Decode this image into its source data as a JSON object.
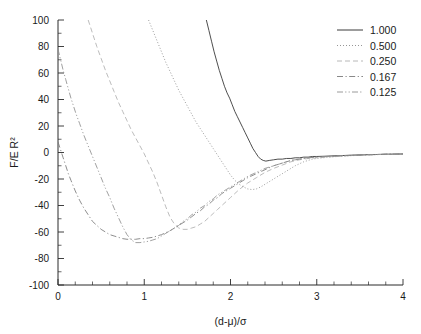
{
  "chart_data": {
    "type": "line",
    "title": "",
    "subtitle": "",
    "xlabel": "(d-μ)/σ",
    "ylabel": "F/E R²",
    "xlim": [
      0,
      4
    ],
    "ylim": [
      -100,
      100
    ],
    "grid": false,
    "legend_position": "top-right",
    "x_ticks": [
      "0",
      "1",
      "2",
      "3",
      "4"
    ],
    "x_tick_values": [
      0,
      1,
      2,
      3,
      4
    ],
    "x_minor_ticks_per_interval": 5,
    "y_ticks": [
      "100",
      "80",
      "60",
      "40",
      "20",
      "0",
      "-20",
      "-40",
      "-60",
      "-80",
      "-100"
    ],
    "y_tick_values": [
      100,
      80,
      60,
      40,
      20,
      0,
      -20,
      -40,
      -60,
      -80,
      -100
    ],
    "y_minor_ticks_per_interval": 2,
    "series": [
      {
        "name": "1.000",
        "style": "solid",
        "color": "#3a3a3a",
        "points": [
          [
            1.72,
            100
          ],
          [
            1.75,
            92
          ],
          [
            1.78,
            84
          ],
          [
            1.81,
            76
          ],
          [
            1.84,
            69
          ],
          [
            1.87,
            62
          ],
          [
            1.9,
            56
          ],
          [
            1.93,
            50
          ],
          [
            1.96,
            45
          ],
          [
            1.99,
            41
          ],
          [
            2.02,
            36
          ],
          [
            2.05,
            31
          ],
          [
            2.08,
            27
          ],
          [
            2.11,
            23
          ],
          [
            2.14,
            19
          ],
          [
            2.17,
            15
          ],
          [
            2.2,
            11
          ],
          [
            2.23,
            7
          ],
          [
            2.26,
            3
          ],
          [
            2.29,
            0
          ],
          [
            2.32,
            -3
          ],
          [
            2.35,
            -5
          ],
          [
            2.38,
            -6
          ],
          [
            2.41,
            -6.5
          ],
          [
            2.45,
            -6
          ],
          [
            2.5,
            -5.5
          ],
          [
            2.55,
            -5
          ],
          [
            2.6,
            -5
          ],
          [
            2.65,
            -4.5
          ],
          [
            2.7,
            -4.5
          ],
          [
            2.75,
            -4
          ],
          [
            2.8,
            -4
          ],
          [
            2.85,
            -3.5
          ],
          [
            2.9,
            -3.5
          ],
          [
            2.95,
            -3
          ],
          [
            3.0,
            -3
          ],
          [
            3.1,
            -2.8
          ],
          [
            3.2,
            -2.5
          ],
          [
            3.3,
            -2.3
          ],
          [
            3.4,
            -2
          ],
          [
            3.5,
            -1.8
          ],
          [
            3.6,
            -1.6
          ],
          [
            3.7,
            -1.5
          ],
          [
            3.8,
            -1.3
          ],
          [
            3.9,
            -1.2
          ],
          [
            4.0,
            -1.1
          ]
        ]
      },
      {
        "name": "0.500",
        "style": "dotted",
        "color": "#8a8a8a",
        "points": [
          [
            1.05,
            100
          ],
          [
            1.1,
            92
          ],
          [
            1.15,
            84
          ],
          [
            1.2,
            76
          ],
          [
            1.25,
            68
          ],
          [
            1.3,
            61
          ],
          [
            1.35,
            54
          ],
          [
            1.4,
            47
          ],
          [
            1.45,
            41
          ],
          [
            1.5,
            35
          ],
          [
            1.55,
            29
          ],
          [
            1.6,
            23
          ],
          [
            1.65,
            18
          ],
          [
            1.7,
            13
          ],
          [
            1.75,
            8
          ],
          [
            1.8,
            3
          ],
          [
            1.85,
            -2
          ],
          [
            1.9,
            -7
          ],
          [
            1.95,
            -12
          ],
          [
            2.0,
            -17
          ],
          [
            2.05,
            -21
          ],
          [
            2.1,
            -24
          ],
          [
            2.15,
            -26
          ],
          [
            2.2,
            -27.5
          ],
          [
            2.25,
            -28
          ],
          [
            2.3,
            -27.5
          ],
          [
            2.35,
            -26
          ],
          [
            2.4,
            -24
          ],
          [
            2.45,
            -22
          ],
          [
            2.5,
            -20
          ],
          [
            2.55,
            -18
          ],
          [
            2.6,
            -16
          ],
          [
            2.65,
            -14
          ],
          [
            2.7,
            -12
          ],
          [
            2.75,
            -10
          ],
          [
            2.8,
            -8.5
          ],
          [
            2.85,
            -7
          ],
          [
            2.9,
            -6
          ],
          [
            2.95,
            -5
          ],
          [
            3.0,
            -4.5
          ],
          [
            3.1,
            -3.8
          ],
          [
            3.2,
            -3.2
          ],
          [
            3.3,
            -2.8
          ],
          [
            3.4,
            -2.4
          ],
          [
            3.5,
            -2.1
          ],
          [
            3.6,
            -1.8
          ],
          [
            3.7,
            -1.6
          ],
          [
            3.8,
            -1.4
          ],
          [
            3.9,
            -1.2
          ],
          [
            4.0,
            -1.1
          ]
        ]
      },
      {
        "name": "0.250",
        "style": "dash",
        "color": "#b0b0b0",
        "points": [
          [
            0.35,
            100
          ],
          [
            0.4,
            90
          ],
          [
            0.45,
            80
          ],
          [
            0.5,
            71
          ],
          [
            0.55,
            62
          ],
          [
            0.6,
            54
          ],
          [
            0.65,
            46
          ],
          [
            0.7,
            38
          ],
          [
            0.75,
            31
          ],
          [
            0.8,
            24
          ],
          [
            0.85,
            17
          ],
          [
            0.9,
            11
          ],
          [
            0.95,
            5
          ],
          [
            1.0,
            -1
          ],
          [
            1.05,
            -8
          ],
          [
            1.1,
            -15
          ],
          [
            1.15,
            -23
          ],
          [
            1.2,
            -32
          ],
          [
            1.25,
            -41
          ],
          [
            1.3,
            -49
          ],
          [
            1.35,
            -54
          ],
          [
            1.4,
            -57
          ],
          [
            1.45,
            -58
          ],
          [
            1.5,
            -58
          ],
          [
            1.55,
            -57
          ],
          [
            1.6,
            -56
          ],
          [
            1.65,
            -54
          ],
          [
            1.7,
            -52
          ],
          [
            1.75,
            -49
          ],
          [
            1.8,
            -46
          ],
          [
            1.85,
            -43
          ],
          [
            1.9,
            -40
          ],
          [
            1.95,
            -37
          ],
          [
            2.0,
            -34
          ],
          [
            2.05,
            -31
          ],
          [
            2.1,
            -28
          ],
          [
            2.2,
            -23
          ],
          [
            2.3,
            -19
          ],
          [
            2.4,
            -15
          ],
          [
            2.5,
            -12
          ],
          [
            2.6,
            -9.5
          ],
          [
            2.7,
            -7
          ],
          [
            2.8,
            -5.5
          ],
          [
            2.9,
            -4.5
          ],
          [
            3.0,
            -4
          ],
          [
            3.1,
            -3.5
          ],
          [
            3.2,
            -3
          ],
          [
            3.3,
            -2.6
          ],
          [
            3.4,
            -2.3
          ],
          [
            3.5,
            -2
          ],
          [
            3.6,
            -1.7
          ],
          [
            3.7,
            -1.5
          ],
          [
            3.8,
            -1.3
          ],
          [
            3.9,
            -1.2
          ],
          [
            4.0,
            -1.1
          ]
        ]
      },
      {
        "name": "0.167",
        "style": "dashdot",
        "color": "#7a7a7a",
        "points": [
          [
            0.0,
            8
          ],
          [
            0.03,
            2
          ],
          [
            0.06,
            -4
          ],
          [
            0.09,
            -10
          ],
          [
            0.12,
            -16
          ],
          [
            0.15,
            -21
          ],
          [
            0.2,
            -29
          ],
          [
            0.25,
            -36
          ],
          [
            0.3,
            -42
          ],
          [
            0.35,
            -47
          ],
          [
            0.4,
            -52
          ],
          [
            0.45,
            -55
          ],
          [
            0.5,
            -58
          ],
          [
            0.55,
            -60
          ],
          [
            0.6,
            -62
          ],
          [
            0.65,
            -63
          ],
          [
            0.7,
            -64
          ],
          [
            0.75,
            -65
          ],
          [
            0.8,
            -65.5
          ],
          [
            0.85,
            -65.5
          ],
          [
            0.9,
            -65.5
          ],
          [
            0.95,
            -65
          ],
          [
            1.0,
            -65
          ],
          [
            1.05,
            -64.5
          ],
          [
            1.1,
            -64
          ],
          [
            1.15,
            -63
          ],
          [
            1.2,
            -62
          ],
          [
            1.25,
            -60.5
          ],
          [
            1.3,
            -59
          ],
          [
            1.35,
            -57
          ],
          [
            1.4,
            -55
          ],
          [
            1.45,
            -53
          ],
          [
            1.5,
            -51
          ],
          [
            1.55,
            -48.5
          ],
          [
            1.6,
            -46
          ],
          [
            1.65,
            -44
          ],
          [
            1.7,
            -41
          ],
          [
            1.75,
            -39
          ],
          [
            1.8,
            -36
          ],
          [
            1.85,
            -34
          ],
          [
            1.9,
            -31
          ],
          [
            1.95,
            -29
          ],
          [
            2.0,
            -27
          ],
          [
            2.1,
            -23
          ],
          [
            2.2,
            -19
          ],
          [
            2.3,
            -16
          ],
          [
            2.4,
            -13
          ],
          [
            2.5,
            -10
          ],
          [
            2.6,
            -8
          ],
          [
            2.7,
            -6
          ],
          [
            2.8,
            -5
          ],
          [
            2.9,
            -4
          ],
          [
            3.0,
            -3.5
          ],
          [
            3.1,
            -3
          ],
          [
            3.2,
            -2.7
          ],
          [
            3.3,
            -2.4
          ],
          [
            3.4,
            -2.2
          ],
          [
            3.5,
            -2
          ],
          [
            3.6,
            -1.7
          ],
          [
            3.7,
            -1.5
          ],
          [
            3.8,
            -1.3
          ],
          [
            3.9,
            -1.2
          ],
          [
            4.0,
            -1.1
          ]
        ]
      },
      {
        "name": "0.125",
        "style": "dashdotdot",
        "color": "#8f8f8f",
        "points": [
          [
            0.0,
            78
          ],
          [
            0.03,
            70
          ],
          [
            0.06,
            62
          ],
          [
            0.09,
            55
          ],
          [
            0.12,
            48
          ],
          [
            0.15,
            41
          ],
          [
            0.18,
            35
          ],
          [
            0.21,
            29
          ],
          [
            0.25,
            22
          ],
          [
            0.3,
            13
          ],
          [
            0.35,
            5
          ],
          [
            0.4,
            -3
          ],
          [
            0.45,
            -11
          ],
          [
            0.5,
            -19
          ],
          [
            0.55,
            -27
          ],
          [
            0.6,
            -34
          ],
          [
            0.65,
            -42
          ],
          [
            0.7,
            -49
          ],
          [
            0.75,
            -56
          ],
          [
            0.8,
            -62
          ],
          [
            0.85,
            -66
          ],
          [
            0.9,
            -68
          ],
          [
            0.95,
            -68
          ],
          [
            1.0,
            -67.5
          ],
          [
            1.05,
            -67
          ],
          [
            1.1,
            -66
          ],
          [
            1.15,
            -65
          ],
          [
            1.2,
            -63
          ],
          [
            1.25,
            -61
          ],
          [
            1.3,
            -59
          ],
          [
            1.35,
            -57
          ],
          [
            1.4,
            -55
          ],
          [
            1.45,
            -52
          ],
          [
            1.5,
            -50
          ],
          [
            1.55,
            -47
          ],
          [
            1.6,
            -45
          ],
          [
            1.65,
            -42
          ],
          [
            1.7,
            -40
          ],
          [
            1.75,
            -37
          ],
          [
            1.8,
            -35
          ],
          [
            1.85,
            -32
          ],
          [
            1.9,
            -30
          ],
          [
            1.95,
            -28
          ],
          [
            2.0,
            -26
          ],
          [
            2.1,
            -22
          ],
          [
            2.2,
            -18
          ],
          [
            2.3,
            -15
          ],
          [
            2.4,
            -12
          ],
          [
            2.5,
            -10
          ],
          [
            2.6,
            -8
          ],
          [
            2.7,
            -6
          ],
          [
            2.8,
            -5
          ],
          [
            2.9,
            -4
          ],
          [
            3.0,
            -3.5
          ],
          [
            3.1,
            -3
          ],
          [
            3.2,
            -2.7
          ],
          [
            3.3,
            -2.4
          ],
          [
            3.4,
            -2.2
          ],
          [
            3.5,
            -2
          ],
          [
            3.6,
            -1.7
          ],
          [
            3.7,
            -1.5
          ],
          [
            3.8,
            -1.3
          ],
          [
            3.9,
            -1.2
          ],
          [
            4.0,
            -1.1
          ]
        ]
      }
    ],
    "legend": [
      {
        "label": "1.000",
        "style": "solid"
      },
      {
        "label": "0.500",
        "style": "dotted"
      },
      {
        "label": "0.250",
        "style": "dash"
      },
      {
        "label": "0.167",
        "style": "dashdot"
      },
      {
        "label": "0.125",
        "style": "dashdotdot"
      }
    ]
  }
}
